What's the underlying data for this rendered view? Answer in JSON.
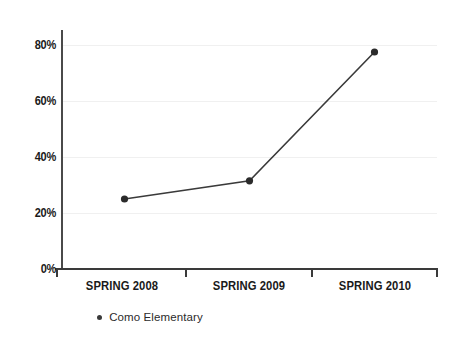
{
  "chart_data": {
    "type": "line",
    "title": "",
    "xlabel": "",
    "ylabel": "",
    "categories": [
      "SPRING 2008",
      "SPRING 2009",
      "SPRING 2010"
    ],
    "series": [
      {
        "name": "Como Elementary",
        "values": [
          25,
          31.5,
          77.5
        ]
      }
    ],
    "ylim": [
      0,
      85
    ],
    "y_ticks": [
      0,
      20,
      40,
      60,
      80
    ],
    "y_tick_labels": [
      "0%",
      "20%",
      "40%",
      "60%",
      "80%"
    ],
    "grid": true,
    "legend_position": "bottom-left",
    "colors": {
      "line": "#3a3a3a",
      "marker": "#2b2b2b",
      "gridline": "#f0f0f0",
      "axis": "#3a3a3a",
      "text": "#1a1a1a"
    }
  },
  "legend": {
    "entries": [
      {
        "label": "Como Elementary",
        "marker": "dot-marker"
      }
    ]
  }
}
